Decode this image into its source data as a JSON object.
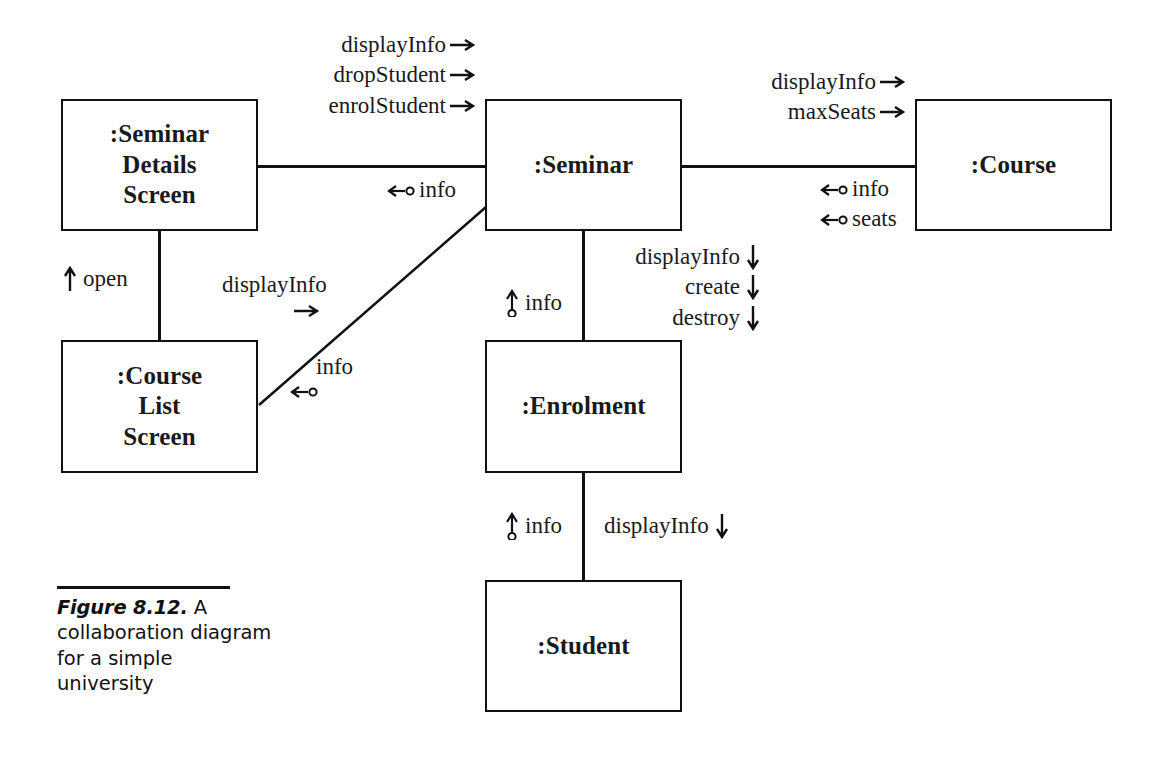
{
  "figure": {
    "label": "Figure 8.12.",
    "description": "A collaboration diagram for a simple university"
  },
  "objects": [
    {
      "id": "seminar-details-screen",
      "lines": [
        ":Seminar",
        "Details",
        "Screen"
      ]
    },
    {
      "id": "seminar",
      "lines": [
        ":Seminar"
      ]
    },
    {
      "id": "course",
      "lines": [
        ":Course"
      ]
    },
    {
      "id": "course-list-screen",
      "lines": [
        ":Course",
        "List",
        "Screen"
      ]
    },
    {
      "id": "enrolment",
      "lines": [
        ":Enrolment"
      ]
    },
    {
      "id": "student",
      "lines": [
        ":Student"
      ]
    }
  ],
  "messages": {
    "details_to_seminar": {
      "calls": [
        "displayInfo",
        "dropStudent",
        "enrolStudent"
      ],
      "returns": [
        "info"
      ]
    },
    "seminar_to_course": {
      "calls": [
        "displayInfo",
        "maxSeats"
      ],
      "returns": [
        "info",
        "seats"
      ]
    },
    "courselist_to_details": {
      "calls": [
        "open"
      ]
    },
    "courselist_to_seminar": {
      "calls": [
        "displayInfo"
      ],
      "returns": [
        "info"
      ]
    },
    "seminar_to_enrolment": {
      "calls": [
        "displayInfo",
        "create",
        "destroy"
      ],
      "returns": [
        "info"
      ]
    },
    "enrolment_to_student": {
      "calls": [
        "displayInfo"
      ],
      "returns": [
        "info"
      ]
    }
  },
  "colors": {
    "ink": "#111111",
    "background": "#ffffff"
  }
}
